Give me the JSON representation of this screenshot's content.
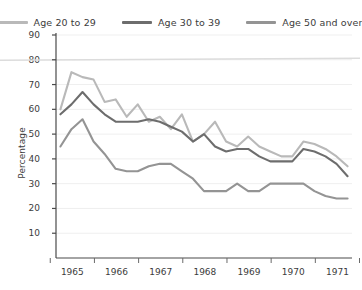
{
  "title_fragment": "",
  "legend": {
    "position": "top-center",
    "items": [
      {
        "label": "Age 20 to 29",
        "color": "#b9b9b9"
      },
      {
        "label": "Age 30 to 39",
        "color": "#6d6d6d"
      },
      {
        "label": "Age 50 and over",
        "color": "#949494"
      }
    ]
  },
  "axis": {
    "ylabel": "Percentage",
    "xlabel": "",
    "yticks": [
      10,
      20,
      30,
      40,
      50,
      60,
      70,
      80,
      90
    ],
    "xticks": [
      "1965",
      "1966",
      "1967",
      "1968",
      "1969",
      "1970",
      "1971"
    ]
  },
  "chart_data": {
    "type": "line",
    "title": "",
    "xlabel": "",
    "ylabel": "Percentage",
    "ylim": [
      0,
      90
    ],
    "xlim": [
      1964.75,
      1971.45
    ],
    "grid": true,
    "legend_position": "top-center",
    "x": [
      1964.85,
      1965.1,
      1965.35,
      1965.6,
      1965.85,
      1966.1,
      1966.35,
      1966.6,
      1966.85,
      1967.1,
      1967.35,
      1967.6,
      1967.85,
      1968.1,
      1968.35,
      1968.6,
      1968.85,
      1969.1,
      1969.35,
      1969.6,
      1969.85,
      1970.1,
      1970.35,
      1970.6,
      1970.85,
      1971.1,
      1971.35
    ],
    "series": [
      {
        "name": "Age 20 to 29",
        "color": "#b9b9b9",
        "values": [
          60,
          75,
          73,
          72,
          63,
          64,
          57,
          62,
          55,
          57,
          52,
          58,
          47,
          50,
          55,
          47,
          45,
          49,
          45,
          43,
          41,
          41,
          47,
          46,
          44,
          41,
          37
        ]
      },
      {
        "name": "Age 30 to 39",
        "color": "#6d6d6d",
        "values": [
          58,
          62,
          67,
          62,
          58,
          55,
          55,
          55,
          56,
          55,
          53,
          51,
          47,
          50,
          45,
          43,
          44,
          44,
          41,
          39,
          39,
          39,
          44,
          43,
          41,
          38,
          33
        ]
      },
      {
        "name": "Age 50 and over",
        "color": "#949494",
        "values": [
          45,
          52,
          56,
          47,
          42,
          36,
          35,
          35,
          37,
          38,
          38,
          35,
          32,
          27,
          27,
          27,
          30,
          27,
          27,
          30,
          30,
          30,
          30,
          27,
          25,
          24,
          24
        ]
      }
    ]
  }
}
